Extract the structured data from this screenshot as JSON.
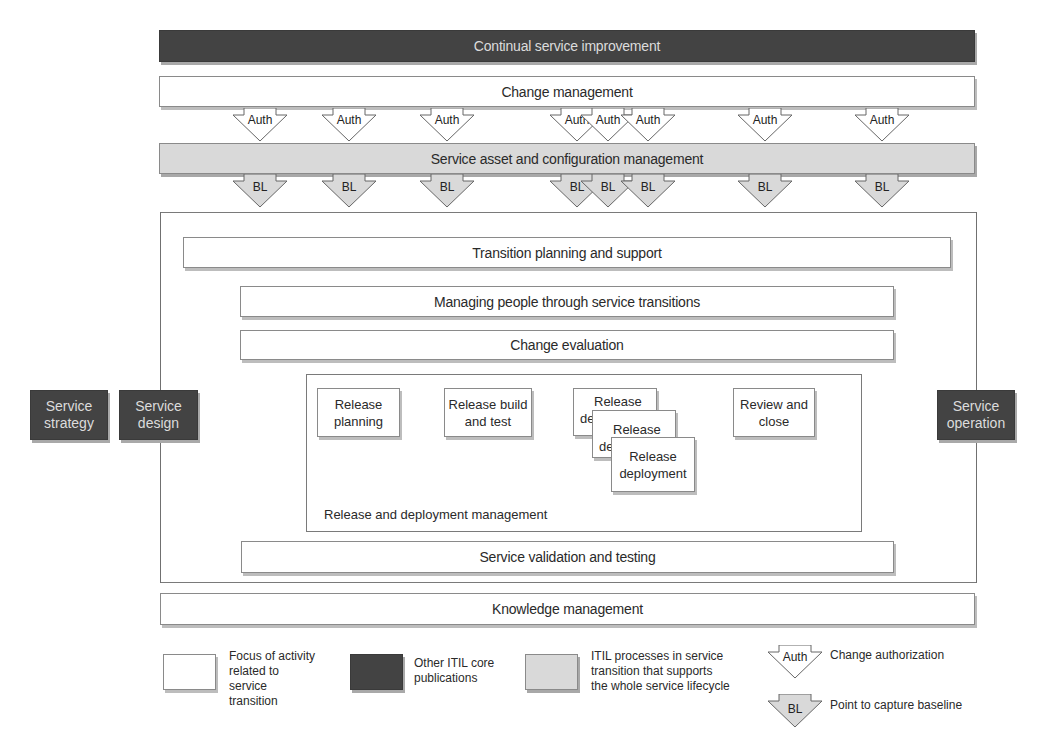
{
  "diagram": {
    "top_bars": {
      "continual_service_improvement": "Continual service improvement",
      "change_management": "Change management",
      "service_asset_config": "Service asset and configuration management"
    },
    "auth_arrows": {
      "label": "Auth",
      "positions_x": [
        260,
        349,
        447,
        577,
        608,
        648,
        765,
        882
      ]
    },
    "bl_arrows": {
      "label": "BL",
      "positions_x": [
        260,
        349,
        447,
        577,
        608,
        648,
        765,
        882
      ]
    },
    "side_publications": {
      "strategy": [
        "Service",
        "strategy"
      ],
      "design": [
        "Service",
        "design"
      ],
      "operation": [
        "Service",
        "operation"
      ]
    },
    "transition_processes": {
      "transition_planning": "Transition planning and support",
      "managing_people": "Managing people through service transitions",
      "change_evaluation": "Change evaluation",
      "service_validation": "Service validation and testing"
    },
    "release_deployment": {
      "title": "Release and deployment management",
      "stages": {
        "planning": [
          "Release",
          "planning"
        ],
        "build_test": [
          "Release build",
          "and test"
        ],
        "deployment": [
          "Release",
          "deployment"
        ],
        "review_close": [
          "Review and",
          "close"
        ]
      }
    },
    "knowledge_management": "Knowledge management"
  },
  "legend": {
    "focus": [
      "Focus of activity",
      "related to",
      "service",
      "transition"
    ],
    "other_core": [
      "Other ITIL core",
      "publications"
    ],
    "supporting": [
      "ITIL processes in service",
      "transition that supports",
      "the whole service lifecycle"
    ],
    "auth_symbol": "Auth",
    "auth_desc": "Change authorization",
    "bl_symbol": "BL",
    "bl_desc": "Point to capture baseline"
  },
  "colors": {
    "dark": "#434343",
    "light_gray": "#d9d9d9",
    "white": "#ffffff",
    "border": "#8a8a8a"
  }
}
